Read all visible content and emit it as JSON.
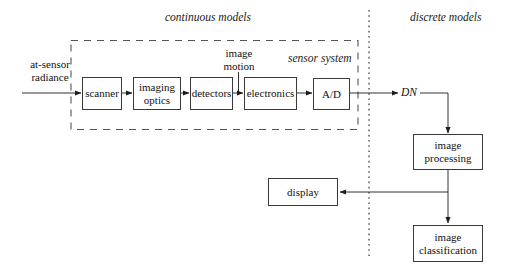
{
  "diagram": {
    "title_regions": [
      {
        "id": "continuous",
        "label": "continuous models"
      },
      {
        "id": "discrete",
        "label": "discrete models"
      }
    ],
    "group_labels": {
      "sensor_system": "sensor system",
      "continuous_models": "continuous models",
      "discrete_models": "discrete models"
    },
    "inputs": {
      "at_sensor_radiance": "at-sensor\nradiance",
      "image_motion": "image\nmotion"
    },
    "signals": {
      "dn": "DN"
    },
    "boxes": [
      {
        "id": "scanner",
        "label": "scanner"
      },
      {
        "id": "imaging-optics",
        "label": "imaging\noptics"
      },
      {
        "id": "detectors",
        "label": "detectors"
      },
      {
        "id": "electronics",
        "label": "electronics"
      },
      {
        "id": "ad-converter",
        "label": "A/D"
      },
      {
        "id": "image-processing",
        "label": "image\nprocessing"
      },
      {
        "id": "display",
        "label": "display"
      },
      {
        "id": "image-classification",
        "label": "image\nclassification"
      }
    ],
    "colors": {
      "stroke": "#3a3a3a",
      "text": "#111111",
      "background": "#ffffff",
      "dashed_boundary": "#555555",
      "dotted_divider": "#444444"
    }
  }
}
